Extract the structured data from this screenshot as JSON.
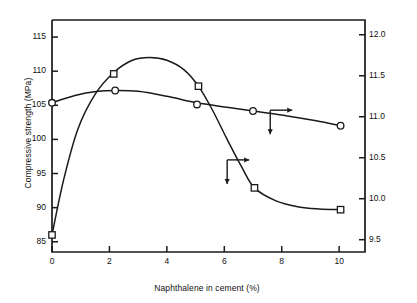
{
  "chart_data": {
    "type": "line",
    "title": "",
    "xlabel": "Naphthalene in cement (%)",
    "ylabel": "Compressive strength (MPa)",
    "y2label": "Splitting tensile strength (MPa)",
    "xlim": [
      0,
      10.9
    ],
    "ylim": [
      83.5,
      117.5
    ],
    "y2lim": [
      9.35,
      12.18
    ],
    "grid": false,
    "legend": "none",
    "xticks": [
      "0",
      "2",
      "4",
      "6",
      "8",
      "10"
    ],
    "xtick_values": [
      0,
      2,
      4,
      6,
      8,
      10
    ],
    "yticks": [
      "85",
      "90",
      "95",
      "100",
      "105",
      "110",
      "115"
    ],
    "ytick_values": [
      85,
      90,
      95,
      100,
      105,
      110,
      115
    ],
    "y2ticks": [
      "9.5",
      "10.0",
      "10.5",
      "11.0",
      "11.5",
      "12.0"
    ],
    "y2tick_values": [
      9.5,
      10.0,
      10.5,
      11.0,
      11.5,
      12.0
    ],
    "series": [
      {
        "name": "Compressive strength",
        "axis": "left",
        "marker": "square",
        "x": [
          0,
          2.15,
          5.1,
          7.05,
          10.05
        ],
        "values": [
          86.0,
          109.6,
          107.8,
          92.9,
          89.7
        ],
        "curve_x": [
          0,
          0.4,
          0.9,
          1.5,
          2.15,
          2.8,
          3.4,
          4.0,
          4.6,
          5.1,
          5.6,
          6.1,
          6.6,
          7.05,
          7.8,
          8.6,
          9.3,
          10.05
        ],
        "curve_y": [
          86.0,
          94.0,
          101.5,
          106.6,
          109.8,
          111.6,
          112.0,
          111.6,
          110.2,
          107.8,
          104.2,
          100.0,
          96.0,
          92.9,
          91.0,
          90.1,
          89.8,
          89.7
        ]
      },
      {
        "name": "Splitting tensile strength",
        "axis": "right",
        "marker": "circle",
        "x": [
          0,
          2.2,
          5.05,
          7.0,
          10.05
        ],
        "values": [
          11.17,
          11.32,
          11.15,
          11.07,
          10.89
        ],
        "curve_x": [
          0,
          0.8,
          1.6,
          2.2,
          3.0,
          4.0,
          5.05,
          6.0,
          7.0,
          8.2,
          9.2,
          10.05
        ],
        "curve_y": [
          11.17,
          11.26,
          11.31,
          11.32,
          11.31,
          11.25,
          11.17,
          11.12,
          11.07,
          11.01,
          10.95,
          10.89
        ]
      }
    ],
    "annotations": [
      {
        "name": "compressive-axis-arrow",
        "description": "arrow pointing right toward compressive curve with downward stem",
        "direction": "right",
        "x": 6.1,
        "y_value": 97.0
      },
      {
        "name": "tensile-axis-arrow",
        "description": "arrow pointing right toward tensile curve with downward stem",
        "direction": "right",
        "x": 7.6,
        "y2_value": 11.08
      }
    ],
    "colors": {
      "line": "#1a1a1a",
      "axis": "#1a1a1a",
      "marker_fill": "#ffffff",
      "background": "#ffffff"
    }
  }
}
